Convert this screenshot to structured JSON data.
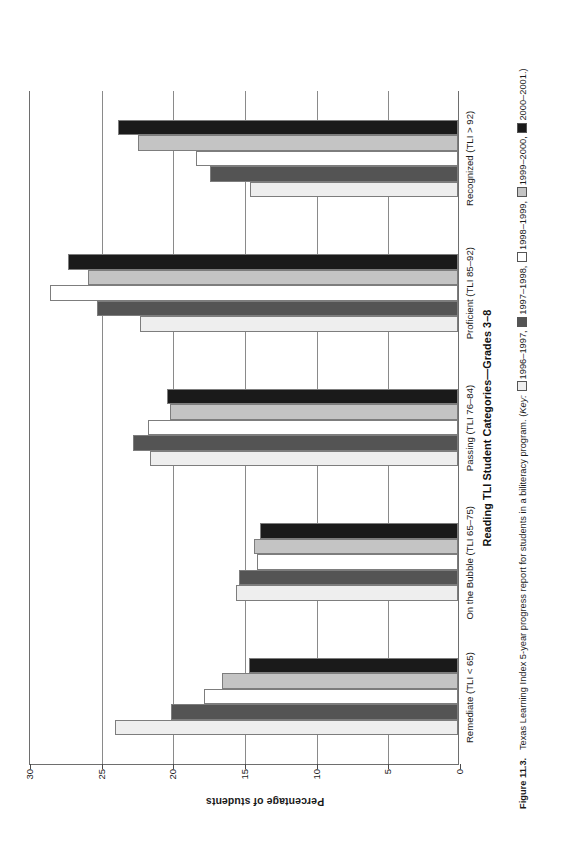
{
  "figure": {
    "number_label": "Figure 11.3.",
    "caption_text": "Texas Learning Index 5-year progress report for students in a biliteracy program.",
    "key_word": "Key:",
    "key_open_paren": "(",
    "key_close": ".)"
  },
  "chart_data": {
    "type": "bar",
    "title": "",
    "xlabel": "Reading TLI Student Categories—Grades 3–8",
    "ylabel": "Percentage of students",
    "ylim": [
      0,
      30
    ],
    "yticks": [
      0,
      5,
      10,
      15,
      20,
      25,
      30
    ],
    "ytick_labels": [
      "0",
      "5",
      "10",
      "15",
      "20",
      "25",
      "30"
    ],
    "grid": true,
    "legend_position": "caption",
    "orientation": "horizontal-bars-rotated",
    "categories": [
      "Remediate (TLI < 65)",
      "On the Bubble (TLI 65–75)",
      "Passing (TLI 76–84)",
      "Proficient (TLI 85–92)",
      "Recognized (TLI > 92)"
    ],
    "series": [
      {
        "name": "1996–1997",
        "color": "#eeeeee",
        "values": [
          23.9,
          15.5,
          21.5,
          22.2,
          14.5
        ]
      },
      {
        "name": "1997–1998",
        "color": "#545454",
        "values": [
          20.0,
          15.3,
          22.7,
          25.2,
          17.3
        ]
      },
      {
        "name": "1998–1999",
        "color": "#ffffff",
        "values": [
          17.7,
          14.0,
          21.6,
          28.5,
          18.3
        ]
      },
      {
        "name": "1999–2000",
        "color": "#c4c4c4",
        "values": [
          16.5,
          14.2,
          20.1,
          25.8,
          22.3
        ]
      },
      {
        "name": "2000–2001",
        "color": "#1a1a1a",
        "values": [
          14.6,
          13.8,
          20.3,
          27.2,
          23.7
        ]
      }
    ]
  },
  "colors": {
    "axis": "#6e6e6e",
    "grid": "#8a8a8a",
    "text": "#1a1a1a",
    "bar_border": "#7d7d7d"
  }
}
